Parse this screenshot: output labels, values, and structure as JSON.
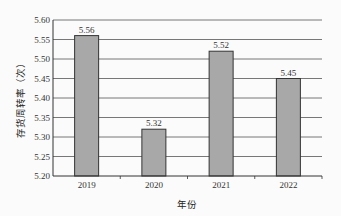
{
  "chart_data": {
    "type": "bar",
    "title": "",
    "xlabel": "年份",
    "ylabel": "存货周转率（次）",
    "categories": [
      "2019",
      "2020",
      "2021",
      "2022"
    ],
    "values": [
      5.56,
      5.32,
      5.52,
      5.45
    ],
    "data_labels": [
      "5.56",
      "5.32",
      "5.52",
      "5.45"
    ],
    "ylim": [
      5.2,
      5.6
    ],
    "yticks": [
      "5.20",
      "5.25",
      "5.30",
      "5.35",
      "5.40",
      "5.45",
      "5.50",
      "5.55",
      "5.60"
    ],
    "grid": true,
    "legend": null,
    "colors": {
      "bar": "#a8a8a8",
      "bar_border": "#333333",
      "grid": "#555555"
    }
  }
}
